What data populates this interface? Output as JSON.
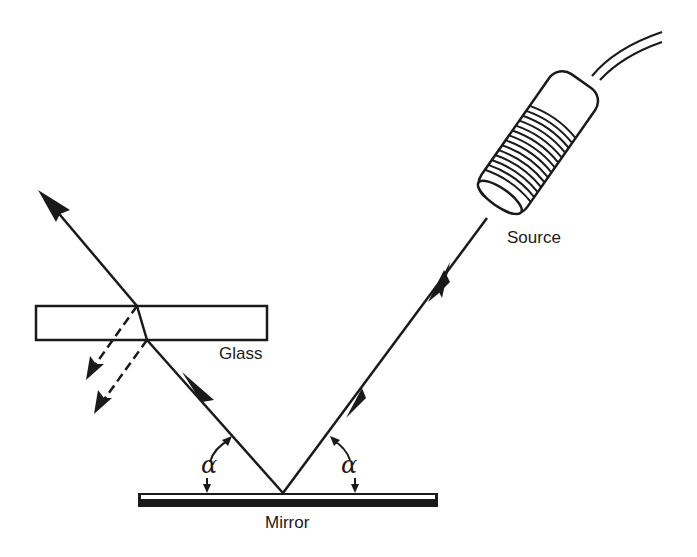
{
  "diagram": {
    "type": "optics-reflection",
    "labels": {
      "source": "Source",
      "glass": "Glass",
      "mirror": "Mirror",
      "angle_left": "α",
      "angle_right": "α"
    },
    "colors": {
      "ink": "#1a1a1a",
      "background": "#ffffff"
    }
  }
}
